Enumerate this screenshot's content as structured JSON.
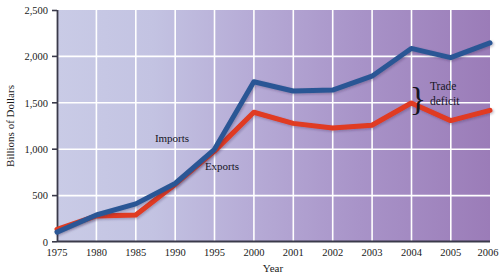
{
  "chart_data": {
    "type": "line",
    "title": "",
    "xlabel": "Year",
    "ylabel": "Billions of Dollars",
    "x": [
      "1975",
      "1980",
      "1985",
      "1990",
      "1995",
      "2000",
      "2001",
      "2002",
      "2003",
      "2004",
      "2005",
      "2006"
    ],
    "xtick_labels": [
      "1975",
      "1980",
      "1985",
      "1990",
      "1995",
      "2000",
      "2001",
      "2002",
      "2003",
      "2004",
      "2005",
      "2006"
    ],
    "ytick_labels": [
      "0",
      "500",
      "1,000",
      "1,500",
      "2,000",
      "2,500"
    ],
    "ytick_values": [
      0,
      500,
      1000,
      1500,
      2000,
      2500
    ],
    "ylim": [
      0,
      2500
    ],
    "grid": true,
    "legend_position": "inline",
    "series": [
      {
        "name": "Imports",
        "color": "#2B5795",
        "values": [
          105,
          290,
          410,
          630,
          1000,
          1730,
          1630,
          1640,
          1790,
          2090,
          1990,
          2150
        ]
      },
      {
        "name": "Exports",
        "color": "#E03A20",
        "values": [
          135,
          280,
          290,
          620,
          980,
          1400,
          1280,
          1230,
          1260,
          1500,
          1310,
          1420
        ]
      }
    ],
    "annotations": [
      {
        "name": "trade-deficit",
        "text_line1": "Trade",
        "text_line2": "deficit",
        "brace_glyph": "}"
      }
    ],
    "plot_bg_gradient_from": "#c9cbe6",
    "plot_bg_gradient_to": "#9b7cb8",
    "gridline_color": "#ffffff",
    "axis_color": "#3a3a4a",
    "page_bg": "#ffffff"
  }
}
